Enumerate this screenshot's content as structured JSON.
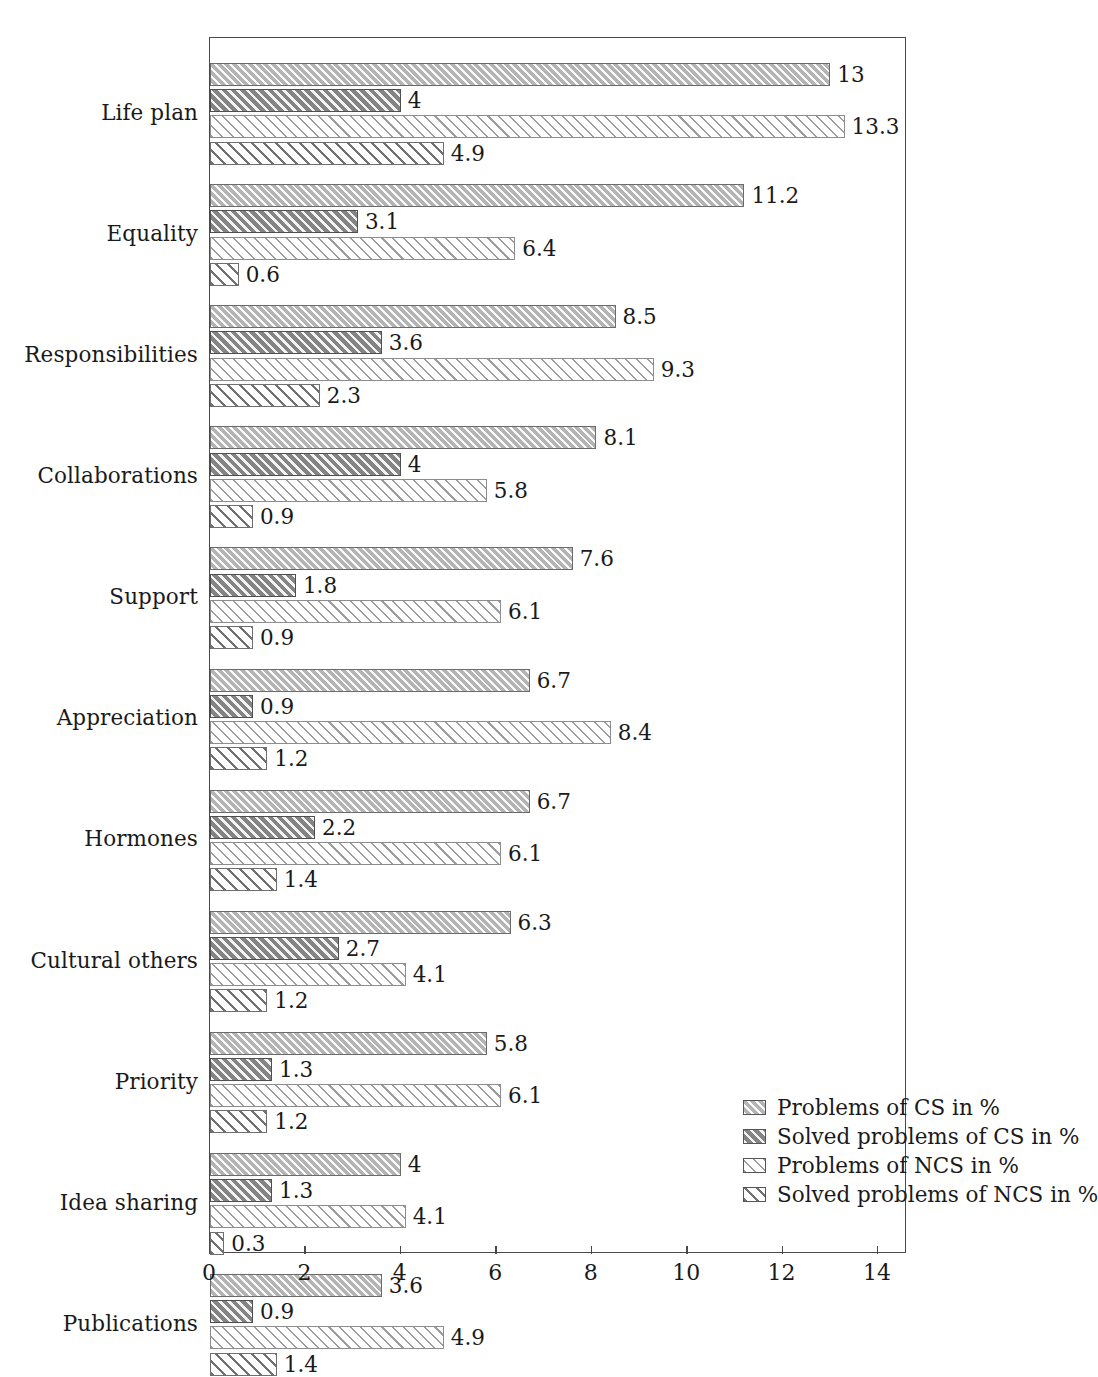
{
  "chart_data": {
    "type": "bar",
    "orientation": "horizontal",
    "grouped": true,
    "title": "",
    "xlabel": "",
    "ylabel": "",
    "xlim": [
      0,
      14
    ],
    "xticks": [
      0,
      2,
      4,
      6,
      8,
      10,
      12,
      14
    ],
    "xtick_labels": [
      "0",
      "2",
      "4",
      "6",
      "8",
      "10",
      "12",
      "14"
    ],
    "grid": false,
    "legend_position": "bottom-right",
    "categories": [
      "Life plan",
      "Equality",
      "Responsibilities",
      "Collaborations",
      "Support",
      "Appreciation",
      "Hormones",
      "Cultural others",
      "Priority",
      "Idea sharing",
      "Publications"
    ],
    "series": [
      {
        "name": "Problems of CS in %",
        "color": "#b4b4b4",
        "values": [
          13,
          11.2,
          8.5,
          8.1,
          7.6,
          6.7,
          6.7,
          6.3,
          5.8,
          4,
          3.6
        ],
        "labels": [
          "13",
          "11.2",
          "8.5",
          "8.1",
          "7.6",
          "6.7",
          "6.7",
          "6.3",
          "5.8",
          "4",
          "3.6"
        ]
      },
      {
        "name": "Solved problems of CS in %",
        "color": "#848484",
        "values": [
          4,
          3.1,
          3.6,
          4,
          1.8,
          0.9,
          2.2,
          2.7,
          1.3,
          1.3,
          0.9
        ],
        "labels": [
          "4",
          "3.1",
          "3.6",
          "4",
          "1.8",
          "0.9",
          "2.2",
          "2.7",
          "1.3",
          "1.3",
          "0.9"
        ]
      },
      {
        "name": "Problems of NCS in %",
        "color": "#ffffff",
        "values": [
          13.3,
          6.4,
          9.3,
          5.8,
          6.1,
          8.4,
          6.1,
          4.1,
          6.1,
          4.1,
          4.9
        ],
        "labels": [
          "13.3",
          "6.4",
          "9.3",
          "5.8",
          "6.1",
          "8.4",
          "6.1",
          "4.1",
          "6.1",
          "4.1",
          "4.9"
        ]
      },
      {
        "name": "Solved problems of NCS in %",
        "color": "#ffffff",
        "values": [
          4.9,
          0.6,
          2.3,
          0.9,
          0.9,
          1.2,
          1.4,
          1.2,
          1.2,
          0.3,
          1.4
        ],
        "labels": [
          "4.9",
          "0.6",
          "2.3",
          "0.9",
          "0.9",
          "1.2",
          "1.4",
          "1.2",
          "1.2",
          "0.3",
          "1.4"
        ]
      }
    ]
  }
}
